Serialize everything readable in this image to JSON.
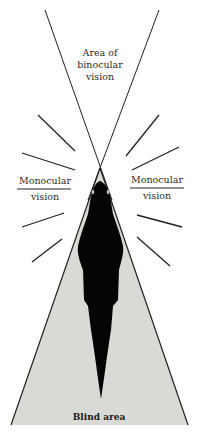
{
  "diagram": {
    "colors": {
      "background": "#ffffff",
      "line": "#222222",
      "blind_area_fill": "#d9d9d6",
      "silhouette": "#050505",
      "text": "#2a2a2a"
    },
    "labels": {
      "binocular": [
        "Area of",
        "binocular",
        "vision"
      ],
      "monocular_left": {
        "top": "Monocular",
        "bottom": "vision"
      },
      "monocular_right": {
        "top": "Monocular",
        "bottom": "vision"
      },
      "blind": "Blind area"
    },
    "icons": {
      "silhouette": "horse-top-view-silhouette"
    }
  }
}
